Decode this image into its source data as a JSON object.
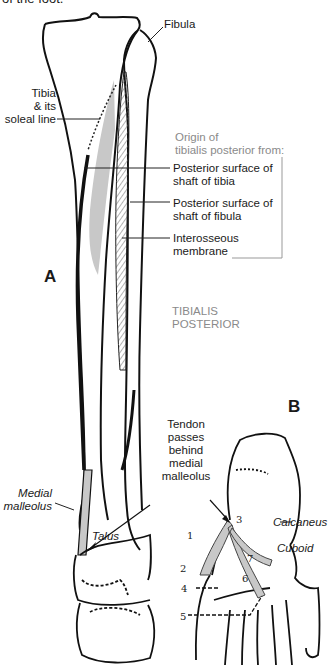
{
  "caption_fragment": "of the foot.",
  "panel_a": {
    "letter": "A",
    "labels": {
      "fibula": "Fibula",
      "tibia_line1": "Tibia",
      "tibia_line2": "& its",
      "tibia_line3": "soleal line",
      "origin_line1": "Origin of",
      "origin_line2": "tibialis posterior from:",
      "post_tibia_line1": "Posterior surface of",
      "post_tibia_line2": "shaft of tibia",
      "post_fibula_line1": "Posterior surface of",
      "post_fibula_line2": "shaft of fibula",
      "interosseous_line1": "Interosseous",
      "interosseous_line2": "membrane",
      "muscle_line1": "TIBIALIS",
      "muscle_line2": "POSTERIOR",
      "medial_line1": "Medial",
      "medial_line2": "malleolus",
      "talus": "Talus"
    }
  },
  "panel_b": {
    "letter": "B",
    "labels": {
      "tendon_line1": "Tendon",
      "tendon_line2": "passes",
      "tendon_line3": "behind",
      "tendon_line4": "medial",
      "tendon_line5": "malleolus",
      "calcaneus": "Calcaneus",
      "cuboid": "Cuboid"
    },
    "insertion_numbers": [
      "1",
      "2",
      "3",
      "4",
      "5",
      "6",
      "7"
    ]
  },
  "colors": {
    "outline": "#111111",
    "muscle_fill": "#c8c8c8",
    "origin_label": "#8a8a8a",
    "hatch": "#555555"
  }
}
